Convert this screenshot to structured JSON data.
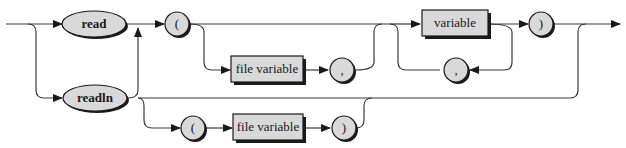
{
  "diagram": {
    "type": "syntax-railroad",
    "keywords": {
      "read": "read",
      "readln": "readln"
    },
    "symbols": {
      "lparen": "(",
      "rparen": ")",
      "comma": ","
    },
    "nonterminals": {
      "file_variable": "file variable",
      "variable": "variable"
    },
    "colors": {
      "fill": "#d9d9d9",
      "stroke": "#1a1a1a",
      "line": "#3a3a3a"
    }
  }
}
